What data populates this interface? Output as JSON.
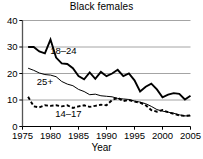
{
  "chart_data": {
    "type": "line",
    "title": "Black females",
    "xlabel": "Year",
    "ylabel": "",
    "xlim": [
      1975,
      2005
    ],
    "ylim": [
      0,
      40
    ],
    "xticks": [
      1975,
      1980,
      1985,
      1990,
      1995,
      2000,
      2005
    ],
    "xtick_labels": [
      "1975",
      "1980",
      "1985",
      "1990",
      "1995",
      "2000",
      "2005"
    ],
    "yticks": [
      0,
      10,
      20,
      30,
      40
    ],
    "ytick_labels": [
      "0",
      "10",
      "20",
      "30",
      "40"
    ],
    "grid": "horizontal",
    "legend_position": "inline-annotations",
    "x": [
      1976,
      1977,
      1978,
      1979,
      1980,
      1981,
      1982,
      1983,
      1984,
      1985,
      1986,
      1987,
      1988,
      1989,
      1990,
      1991,
      1992,
      1993,
      1994,
      1995,
      1996,
      1997,
      1998,
      1999,
      2000,
      2001,
      2002,
      2003,
      2004,
      2005
    ],
    "series": [
      {
        "name": "18-24",
        "label": "18–24",
        "style": "solid",
        "width": 1.9,
        "color": "#000000",
        "label_x": 1982.3,
        "label_y": 27.2,
        "values": [
          30.0,
          30.0,
          28.3,
          27.6,
          32.8,
          26.0,
          23.8,
          23.6,
          22.0,
          19.0,
          17.8,
          20.4,
          18.0,
          20.6,
          19.0,
          20.0,
          21.4,
          19.0,
          20.0,
          17.4,
          13.2,
          15.0,
          16.2,
          14.0,
          11.0,
          12.0,
          12.6,
          12.3,
          10.2,
          11.6
        ]
      },
      {
        "name": "25+",
        "label": "25+",
        "style": "solid",
        "width": 1.0,
        "color": "#000000",
        "label_x": 1979.0,
        "label_y": 15.6,
        "values": [
          22.0,
          21.2,
          20.2,
          19.6,
          19.4,
          18.8,
          17.0,
          16.0,
          15.4,
          14.0,
          13.2,
          12.0,
          12.2,
          11.6,
          11.4,
          11.2,
          10.6,
          10.4,
          10.2,
          9.6,
          9.2,
          8.6,
          7.6,
          6.4,
          5.8,
          5.4,
          5.0,
          4.4,
          4.0,
          4.0
        ]
      },
      {
        "name": "14-17",
        "label": "14–17",
        "style": "dashed",
        "width": 1.9,
        "color": "#000000",
        "label_x": 1983.2,
        "label_y": 3.4,
        "values": [
          11.2,
          7.6,
          7.2,
          8.0,
          7.8,
          8.0,
          7.6,
          8.0,
          7.0,
          7.6,
          8.0,
          7.4,
          7.8,
          8.2,
          8.0,
          10.0,
          10.8,
          9.6,
          10.0,
          9.4,
          9.0,
          8.0,
          6.2,
          5.6,
          6.2,
          5.4,
          4.8,
          4.2,
          4.0,
          4.2
        ]
      }
    ]
  },
  "axis_title": {
    "x": "Year"
  }
}
